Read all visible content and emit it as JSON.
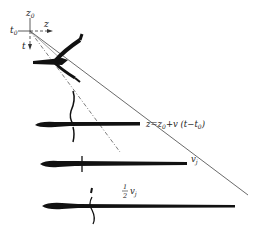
{
  "figure": {
    "axis_labels": {
      "z0": "z",
      "z0_sub": "0",
      "t0": "t",
      "t0_sub": "0",
      "z_axis": "z",
      "t_axis": "t"
    },
    "annotations": {
      "trajectory": "z=z",
      "trajectory_sub": "0",
      "trajectory_rest": "+v (t−t",
      "trajectory_sub2": "0",
      "trajectory_end": ")",
      "front_velocity": "v",
      "front_velocity_sub": "j",
      "half_velocity_num": "1",
      "half_velocity_den": "2",
      "half_velocity_sym": "v",
      "half_velocity_sub": "j"
    },
    "lines": [
      {
        "name": "front-line",
        "style": "solid",
        "meaning": "v_j"
      },
      {
        "name": "half-velocity-line",
        "style": "dash-dot",
        "meaning": "1/2 v_j"
      }
    ],
    "snapshots": 4,
    "colors": {
      "ink": "#111111",
      "background": "#ffffff",
      "line": "#444444"
    }
  }
}
